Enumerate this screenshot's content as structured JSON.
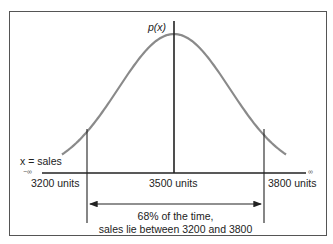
{
  "diagram": {
    "y_label": "p(x)",
    "x_label": "x = sales",
    "neg_infinity": "−∞",
    "pos_infinity": "∞",
    "ticks": {
      "left": "3200 units",
      "center": "3500 units",
      "right": "3800 units"
    },
    "annotation": {
      "line1": "68% of the time,",
      "line2": "sales lie between 3200 and 3800"
    },
    "colors": {
      "curve": "#8a8a8a",
      "axis": "#222222",
      "border": "#555555"
    }
  },
  "chart_data": {
    "type": "line",
    "xlabel": "x = sales",
    "ylabel": "p(x)",
    "mean": 3500,
    "std_dev": 300,
    "x_ticks": [
      3200,
      3500,
      3800
    ],
    "shaded_interval": [
      3200,
      3800
    ],
    "interval_probability_pct": 68,
    "annotation": "68% of the time, sales lie between 3200 and 3800"
  }
}
